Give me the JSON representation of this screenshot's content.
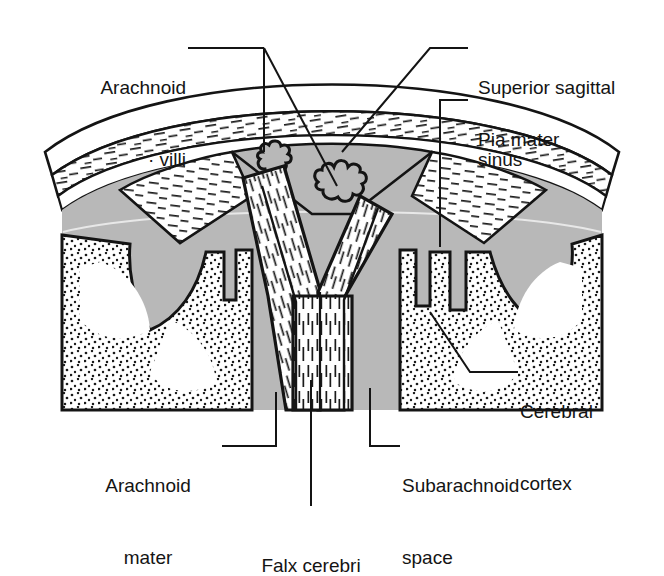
{
  "figure": {
    "kind": "anatomical-cross-section",
    "background_color": "#ffffff",
    "ink_color": "#141414",
    "fill_gray": "#b8b8b8",
    "fill_white": "#ffffff"
  },
  "labels": {
    "arachnoid_villi": {
      "line1": "Arachnoid",
      "line2": "· villi"
    },
    "superior_sagittal_sinus": {
      "line1": "Superior sagittal",
      "line2": "sinus"
    },
    "pia_mater": {
      "line1": "Pia mater"
    },
    "cerebral_cortex": {
      "line1": "Cerebral",
      "line2": "cortex"
    },
    "arachnoid_mater": {
      "line1": "Arachnoid",
      "line2": "mater"
    },
    "subarachnoid_space": {
      "line1": "Subarachnoid",
      "line2": "space"
    },
    "falx_cerebri": {
      "line1": "Falx cerebri"
    }
  },
  "structures": [
    {
      "name": "dura-mater-skull-layer",
      "texture": "dash-hatch",
      "fill": "#ffffff"
    },
    {
      "name": "superior-sagittal-sinus",
      "texture": "solid",
      "fill": "#b8b8b8"
    },
    {
      "name": "subarachnoid-space",
      "texture": "solid",
      "fill": "#b8b8b8"
    },
    {
      "name": "arachnoid-villus-left",
      "texture": "solid",
      "fill": "#b8b8b8"
    },
    {
      "name": "arachnoid-villus-right",
      "texture": "solid",
      "fill": "#b8b8b8"
    },
    {
      "name": "falx-cerebri",
      "texture": "vertical-hatch",
      "fill": "#ffffff"
    },
    {
      "name": "cerebral-cortex-left",
      "texture": "stipple",
      "fill": "#ffffff"
    },
    {
      "name": "cerebral-cortex-right",
      "texture": "stipple",
      "fill": "#ffffff"
    }
  ]
}
